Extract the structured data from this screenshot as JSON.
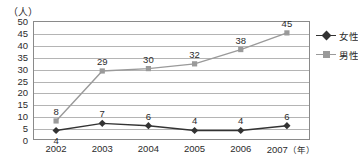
{
  "chart_data": {
    "type": "line",
    "title": "",
    "xlabel": "(年)",
    "ylabel": "(人)",
    "categories": [
      "2002",
      "2003",
      "2004",
      "2005",
      "2006",
      "2007"
    ],
    "x_unit_suffix": "(年)",
    "ylim": [
      0,
      50
    ],
    "y_ticks": [
      "0",
      "5",
      "10",
      "15",
      "20",
      "25",
      "30",
      "35",
      "40",
      "45",
      "50"
    ],
    "grid": true,
    "legend_position": "right",
    "series": [
      {
        "name": "女性",
        "values": [
          4,
          7,
          6,
          4,
          4,
          6
        ],
        "color": "#333333",
        "marker": "diamond",
        "label_positions": [
          "below",
          "above",
          "above",
          "above",
          "above",
          "above"
        ]
      },
      {
        "name": "男性",
        "values": [
          8,
          29,
          30,
          32,
          38,
          45
        ],
        "color": "#9a9a9a",
        "marker": "square",
        "label_positions": [
          "above",
          "above",
          "above",
          "above",
          "above",
          "above"
        ]
      }
    ]
  },
  "axes": {
    "y_title": "（人）",
    "x_unit": "（年）"
  },
  "legend": {
    "items": [
      {
        "label": "女性"
      },
      {
        "label": "男性"
      }
    ]
  },
  "colors": {
    "female_series": "#333333",
    "male_series": "#9a9a9a",
    "gridline": "#b4b4b4",
    "axis_frame": "#8a8a8a",
    "text": "#2b2b2b",
    "background": "#ffffff"
  }
}
